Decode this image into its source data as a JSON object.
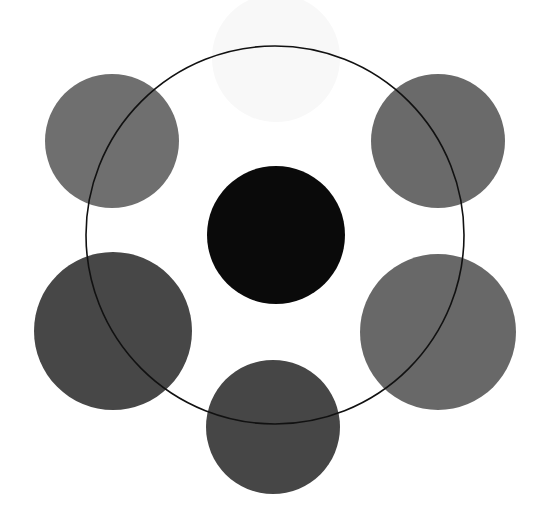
{
  "diagram": {
    "canvas": {
      "width": 544,
      "height": 522,
      "background": "#ffffff"
    },
    "ring": {
      "cx": 275,
      "cy": 235,
      "r": 189,
      "stroke": "#111111",
      "stroke_width": 1.6
    },
    "circles": [
      {
        "name": "top-faint-circle",
        "cx": 276,
        "cy": 58,
        "r": 64,
        "fill": "#f8f8f8"
      },
      {
        "name": "top-left-circle",
        "cx": 112,
        "cy": 141,
        "r": 67,
        "fill": "#6f6f6f"
      },
      {
        "name": "top-right-circle",
        "cx": 438,
        "cy": 141,
        "r": 67,
        "fill": "#6a6a6a"
      },
      {
        "name": "center-circle",
        "cx": 276,
        "cy": 235,
        "r": 69,
        "fill": "#0a0a0a"
      },
      {
        "name": "middle-left-circle",
        "cx": 113,
        "cy": 331,
        "r": 79,
        "fill": "#474747"
      },
      {
        "name": "middle-right-circle",
        "cx": 438,
        "cy": 332,
        "r": 78,
        "fill": "#686868"
      },
      {
        "name": "bottom-circle",
        "cx": 273,
        "cy": 427,
        "r": 67,
        "fill": "#464646"
      }
    ]
  }
}
